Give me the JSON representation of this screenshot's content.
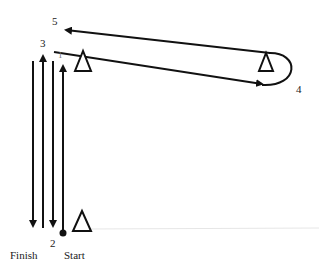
{
  "diagram": {
    "type": "drill-path",
    "labels": {
      "finish": "Finish",
      "start": "Start",
      "point_1": "1",
      "point_2": "2",
      "point_3": "3",
      "point_4": "4",
      "point_5": "5"
    },
    "markers": [
      {
        "id": "cone-near",
        "shape": "triangle"
      },
      {
        "id": "cone-far",
        "shape": "triangle"
      },
      {
        "id": "cone-start",
        "shape": "triangle"
      }
    ],
    "path_segments": [
      {
        "id": "leg-1",
        "from": "Start",
        "to": "1",
        "direction": "up"
      },
      {
        "id": "leg-2",
        "from": "1",
        "to": "2",
        "direction": "down"
      },
      {
        "id": "leg-3",
        "from": "2",
        "to": "3",
        "direction": "up"
      },
      {
        "id": "leg-4",
        "from": "3",
        "to": "4",
        "direction": "right, around far cone"
      },
      {
        "id": "leg-5",
        "from": "4",
        "to": "5",
        "direction": "left"
      },
      {
        "id": "leg-6",
        "from": "5",
        "to": "Finish",
        "direction": "down"
      }
    ],
    "colors": {
      "stroke": "#111111",
      "background": "#ffffff"
    }
  }
}
